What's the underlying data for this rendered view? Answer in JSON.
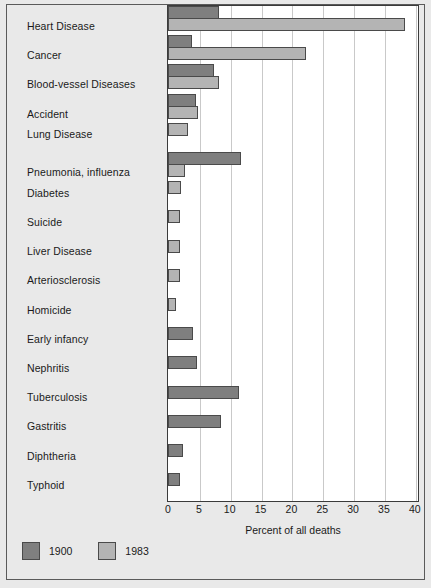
{
  "chart_data": {
    "type": "bar",
    "orientation": "horizontal",
    "title": "",
    "xlabel": "Percent of all deaths",
    "ylabel": "",
    "xlim": [
      0,
      40
    ],
    "xticks": [
      0,
      5,
      10,
      15,
      20,
      25,
      30,
      35,
      40
    ],
    "grid": true,
    "legend_position": "bottom-left",
    "categories": [
      "Heart Disease",
      "Cancer",
      "Blood-vessel Diseases",
      "Accident",
      "Lung Disease",
      "Pneumonia, influenza",
      "Diabetes",
      "Suicide",
      "Liver Disease",
      "Arteriosclerosis",
      "Homicide",
      "Early infancy",
      "Nephritis",
      "Tuberculosis",
      "Gastritis",
      "Diphtheria",
      "Typhoid"
    ],
    "series": [
      {
        "name": "1900",
        "color": "#7f7f7f",
        "values": [
          8.3,
          3.9,
          7.5,
          4.6,
          0,
          11.9,
          0,
          0,
          0,
          0,
          0,
          4.1,
          4.7,
          11.5,
          8.6,
          2.4,
          2.0
        ]
      },
      {
        "name": "1983",
        "color": "#b4b4b4",
        "values": [
          38.4,
          22.4,
          8.3,
          4.8,
          3.3,
          2.8,
          2.1,
          1.9,
          1.9,
          2.0,
          1.3,
          0,
          0,
          0,
          0,
          0,
          0
        ]
      }
    ],
    "legend": [
      {
        "label": "1900",
        "color": "#7f7f7f"
      },
      {
        "label": "1983",
        "color": "#b4b4b4"
      }
    ]
  }
}
